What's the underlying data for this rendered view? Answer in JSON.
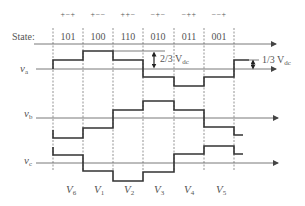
{
  "state_label": "State:",
  "intervals": [
    {
      "signs": "+−+",
      "state": "101",
      "vector": "V",
      "vector_sub": "6",
      "x0": 53,
      "x1": 83
    },
    {
      "signs": "+−−",
      "state": "100",
      "vector": "V",
      "vector_sub": "1",
      "x0": 83,
      "x1": 113
    },
    {
      "signs": "++−",
      "state": "110",
      "vector": "V",
      "vector_sub": "2",
      "x0": 113,
      "x1": 143
    },
    {
      "signs": "−+−",
      "state": "010",
      "vector": "V",
      "vector_sub": "3",
      "x0": 143,
      "x1": 174
    },
    {
      "signs": "−++",
      "state": "011",
      "vector": "V",
      "vector_sub": "4",
      "x0": 174,
      "x1": 204
    },
    {
      "signs": "−−+",
      "state": "001",
      "vector": "V",
      "vector_sub": "5",
      "x0": 204,
      "x1": 234
    }
  ],
  "waveforms": {
    "va": {
      "label": "v",
      "sub": "a",
      "axis_y": 69
    },
    "vb": {
      "label": "v",
      "sub": "b",
      "axis_y": 118
    },
    "vc": {
      "label": "v",
      "sub": "c",
      "axis_y": 163
    }
  },
  "annotations": {
    "two_thirds": {
      "text": "2/3 V",
      "sub": "dc"
    },
    "one_third": {
      "text": "1/3 V",
      "sub": "dc"
    }
  },
  "colors": {
    "waveform": "#333333",
    "axis": "#555555",
    "text": "#555555"
  }
}
